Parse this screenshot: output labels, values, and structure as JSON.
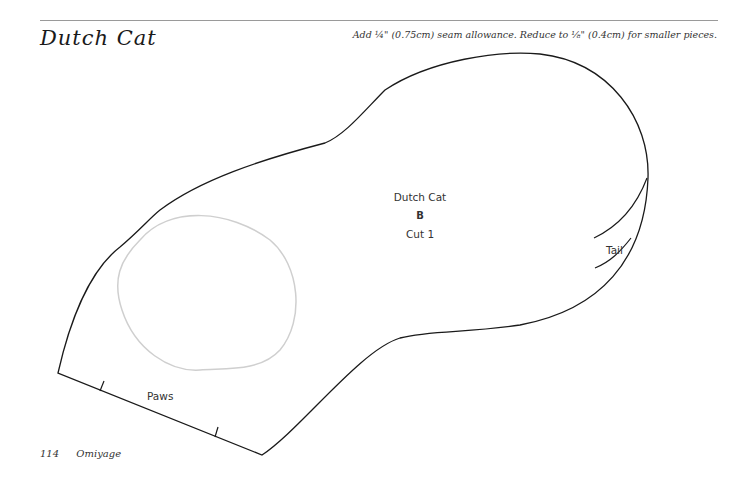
{
  "header": {
    "title": "Dutch Cat",
    "seam_note": "Add ¼\" (0.75cm) seam allowance. Reduce to ⅛\" (0.4cm) for smaller pieces."
  },
  "pattern_piece": {
    "name": "Dutch Cat",
    "letter": "B",
    "cut_instruction": "Cut 1",
    "labels": {
      "tail": "Tail",
      "paws": "Paws"
    },
    "colors": {
      "outline": "#1a1a1a",
      "placement_guide": "#cccccc"
    }
  },
  "footer": {
    "page_number": "114",
    "book_title": "Omiyage"
  }
}
